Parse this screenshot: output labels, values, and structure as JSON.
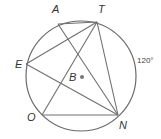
{
  "diagram": {
    "type": "circle-geometry",
    "circle": {
      "center_label": "B",
      "cx": 81,
      "cy": 76,
      "r": 55
    },
    "points": {
      "A": {
        "label": "A",
        "x": 58,
        "y": 24,
        "lx": 52,
        "ly": 13
      },
      "T": {
        "label": "T",
        "x": 97,
        "y": 22,
        "lx": 98,
        "ly": 13
      },
      "E": {
        "label": "E",
        "x": 26,
        "y": 64,
        "lx": 15,
        "ly": 68
      },
      "O": {
        "label": "O",
        "x": 42,
        "y": 115,
        "lx": 27,
        "ly": 121
      },
      "N": {
        "label": "N",
        "x": 118,
        "y": 115,
        "lx": 119,
        "ly": 129
      },
      "B": {
        "label": "B",
        "x": 82,
        "y": 77,
        "lx": 69,
        "ly": 81
      }
    },
    "segments": [
      [
        "A",
        "T"
      ],
      [
        "A",
        "N"
      ],
      [
        "T",
        "E"
      ],
      [
        "T",
        "O"
      ],
      [
        "T",
        "N"
      ],
      [
        "E",
        "N"
      ],
      [
        "O",
        "N"
      ]
    ],
    "arc_annotation": {
      "text": "120°",
      "x": 137,
      "y": 63,
      "arc": "TN"
    }
  }
}
